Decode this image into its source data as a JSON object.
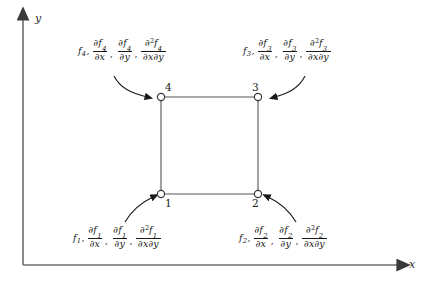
{
  "diagram": {
    "background_color": "#ffffff",
    "line_color": "#4a4a4a",
    "text_color": "#1a1a1a"
  },
  "axes": {
    "x_label": "x",
    "y_label": "y",
    "x_axis_name": "horizontal-axis",
    "y_axis_name": "vertical-axis",
    "arrowhead": "solid-triangle"
  },
  "element": {
    "shape": "square",
    "left": 161,
    "right": 258,
    "top": 97,
    "bottom": 194,
    "node_marker": "open-circle"
  },
  "nodes": [
    {
      "id": "1",
      "label": "1",
      "position": "bottom-left",
      "x": 161,
      "y": 194,
      "label_dx": 4,
      "label_dy": 4
    },
    {
      "id": "2",
      "label": "2",
      "position": "bottom-right",
      "x": 258,
      "y": 194,
      "label_dx": -3,
      "label_dy": 4
    },
    {
      "id": "3",
      "label": "3",
      "position": "top-right",
      "x": 258,
      "y": 97,
      "label_dx": -3,
      "label_dy": -16
    },
    {
      "id": "4",
      "label": "4",
      "position": "top-left",
      "x": 161,
      "y": 97,
      "label_dx": 3,
      "label_dy": -16
    }
  ],
  "annotations": [
    {
      "node": "4",
      "corner": "top-left",
      "subscript": "4",
      "function": "f",
      "terms": [
        {
          "type": "value",
          "text": "f",
          "sub": "4"
        },
        {
          "type": "fraction",
          "num_partial": "∂f",
          "num_sub": "4",
          "den": "∂x"
        },
        {
          "type": "fraction",
          "num_partial": "∂f",
          "num_sub": "4",
          "den": "∂y"
        },
        {
          "type": "fraction",
          "num_partial": "∂",
          "num_sup": "2",
          "num_f": "f",
          "num_sub": "4",
          "den": "∂x∂y"
        }
      ]
    },
    {
      "node": "3",
      "corner": "top-right",
      "subscript": "3",
      "function": "f",
      "terms": [
        {
          "type": "value",
          "text": "f",
          "sub": "3"
        },
        {
          "type": "fraction",
          "num_partial": "∂f",
          "num_sub": "3",
          "den": "∂x"
        },
        {
          "type": "fraction",
          "num_partial": "∂f",
          "num_sub": "3",
          "den": "∂y"
        },
        {
          "type": "fraction",
          "num_partial": "∂",
          "num_sup": "2",
          "num_f": "f",
          "num_sub": "3",
          "den": "∂x∂y"
        }
      ]
    },
    {
      "node": "1",
      "corner": "bottom-left",
      "subscript": "1",
      "function": "f",
      "terms": [
        {
          "type": "value",
          "text": "f",
          "sub": "1"
        },
        {
          "type": "fraction",
          "num_partial": "∂f",
          "num_sub": "1",
          "den": "∂x"
        },
        {
          "type": "fraction",
          "num_partial": "∂f",
          "num_sub": "1",
          "den": "∂y"
        },
        {
          "type": "fraction",
          "num_partial": "∂",
          "num_sup": "2",
          "num_f": "f",
          "num_sub": "1",
          "den": "∂x∂y"
        }
      ]
    },
    {
      "node": "2",
      "corner": "bottom-right",
      "subscript": "2",
      "function": "f",
      "terms": [
        {
          "type": "value",
          "text": "f",
          "sub": "2"
        },
        {
          "type": "fraction",
          "num_partial": "∂f",
          "num_sub": "2",
          "den": "∂x"
        },
        {
          "type": "fraction",
          "num_partial": "∂f",
          "num_sub": "2",
          "den": "∂y"
        },
        {
          "type": "fraction",
          "num_partial": "∂",
          "num_sup": "2",
          "num_f": "f",
          "num_sub": "2",
          "den": "∂x∂y"
        }
      ]
    }
  ],
  "symbols": {
    "partial": "∂",
    "comma": ",",
    "f": "f",
    "x": "x",
    "y": "y",
    "two": "2"
  },
  "connectors": [
    {
      "name": "arrow-to-node-4",
      "from": "label-top-left",
      "to": "node-4",
      "curve": "down-right"
    },
    {
      "name": "arrow-to-node-3",
      "from": "label-top-right",
      "to": "node-3",
      "curve": "down-left"
    },
    {
      "name": "arrow-to-node-1",
      "from": "label-bottom-left",
      "to": "node-1",
      "curve": "up-right"
    },
    {
      "name": "arrow-to-node-2",
      "from": "label-bottom-right",
      "to": "node-2",
      "curve": "up-left"
    }
  ]
}
